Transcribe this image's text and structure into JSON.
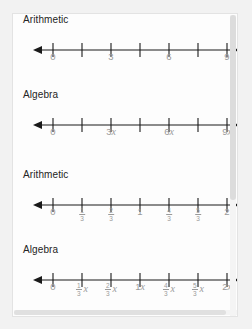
{
  "viewer": {
    "name": "number-line-worksheet",
    "scrollbars": {
      "vertical_name": "vertical-scrollbar",
      "horizontal_name": "horizontal-scrollbar"
    }
  },
  "colors": {
    "page_background": "#fdfdfd",
    "app_background": "#f2f2f2",
    "label_text": "#242424",
    "tick_label_text": "#9a9a9a",
    "axis": "#1a1a1a",
    "border": "#e3e3e3"
  },
  "groups": [
    {
      "id": "group-whole-numbers",
      "blocks": [
        {
          "id": "arithmetic-whole",
          "label": "Arithmetic",
          "tick_count": 7,
          "labels": [
            {
              "tick": 0,
              "text": "0",
              "type": "plain"
            },
            {
              "tick": 1,
              "text": "",
              "type": "none"
            },
            {
              "tick": 2,
              "text": "3",
              "type": "plain"
            },
            {
              "tick": 3,
              "text": "",
              "type": "none"
            },
            {
              "tick": 4,
              "text": "6",
              "type": "plain"
            },
            {
              "tick": 5,
              "text": "",
              "type": "none"
            },
            {
              "tick": 6,
              "text": "9",
              "type": "plain"
            }
          ]
        },
        {
          "id": "algebra-whole",
          "label": "Algebra",
          "tick_count": 7,
          "labels": [
            {
              "tick": 0,
              "text": "0",
              "type": "plain"
            },
            {
              "tick": 1,
              "text": "",
              "type": "none"
            },
            {
              "tick": 2,
              "text": "3",
              "type": "variable",
              "variable": "x"
            },
            {
              "tick": 3,
              "text": "",
              "type": "none"
            },
            {
              "tick": 4,
              "text": "6",
              "type": "variable",
              "variable": "x"
            },
            {
              "tick": 5,
              "text": "",
              "type": "none"
            },
            {
              "tick": 6,
              "text": "9",
              "type": "variable",
              "variable": "x"
            }
          ]
        }
      ]
    },
    {
      "id": "group-thirds",
      "blocks": [
        {
          "id": "arithmetic-thirds",
          "label": "Arithmetic",
          "tick_count": 7,
          "labels": [
            {
              "tick": 0,
              "text": "0",
              "type": "plain"
            },
            {
              "tick": 1,
              "type": "fraction",
              "numerator": "1",
              "denominator": "3"
            },
            {
              "tick": 2,
              "type": "fraction",
              "numerator": "2",
              "denominator": "3"
            },
            {
              "tick": 3,
              "text": "1",
              "type": "plain"
            },
            {
              "tick": 4,
              "type": "fraction",
              "numerator": "4",
              "denominator": "3"
            },
            {
              "tick": 5,
              "type": "fraction",
              "numerator": "5",
              "denominator": "3"
            },
            {
              "tick": 6,
              "text": "2",
              "type": "plain"
            }
          ]
        },
        {
          "id": "algebra-thirds",
          "label": "Algebra",
          "tick_count": 7,
          "labels": [
            {
              "tick": 0,
              "text": "0",
              "type": "plain"
            },
            {
              "tick": 1,
              "type": "fraction-variable",
              "numerator": "1",
              "denominator": "3",
              "variable": "x"
            },
            {
              "tick": 2,
              "type": "fraction-variable",
              "numerator": "2",
              "denominator": "3",
              "variable": "x"
            },
            {
              "tick": 3,
              "text": "1",
              "type": "variable",
              "variable": "x"
            },
            {
              "tick": 4,
              "type": "fraction-variable",
              "numerator": "4",
              "denominator": "3",
              "variable": "x"
            },
            {
              "tick": 5,
              "type": "fraction-variable",
              "numerator": "5",
              "denominator": "3",
              "variable": "x"
            },
            {
              "tick": 6,
              "text": "2",
              "type": "variable",
              "variable": "x"
            }
          ]
        }
      ]
    }
  ],
  "chart_data": {
    "type": "line",
    "title": "",
    "xlabel": "",
    "ylabel": "",
    "lines": [
      {
        "name": "Arithmetic (multiples of 3)",
        "tick_values": [
          0,
          1.5,
          3,
          4.5,
          6,
          7.5,
          9
        ],
        "tick_labels": [
          "0",
          "",
          "3",
          "",
          "6",
          "",
          "9"
        ],
        "xlim": [
          -0.75,
          9.75
        ]
      },
      {
        "name": "Algebra (multiples of 3x)",
        "tick_values": [
          0,
          1.5,
          3,
          4.5,
          6,
          7.5,
          9
        ],
        "tick_labels": [
          "0",
          "",
          "3x",
          "",
          "6x",
          "",
          "9x"
        ],
        "xlim": [
          -0.75,
          9.75
        ]
      },
      {
        "name": "Arithmetic (thirds)",
        "tick_values": [
          0,
          0.3333,
          0.6667,
          1,
          1.3333,
          1.6667,
          2
        ],
        "tick_labels": [
          "0",
          "1/3",
          "2/3",
          "1",
          "4/3",
          "5/3",
          "2"
        ],
        "xlim": [
          -0.1667,
          2.1667
        ]
      },
      {
        "name": "Algebra (thirds times x)",
        "tick_values": [
          0,
          0.3333,
          0.6667,
          1,
          1.3333,
          1.6667,
          2
        ],
        "tick_labels": [
          "0",
          "1/3 x",
          "2/3 x",
          "1x",
          "4/3 x",
          "5/3 x",
          "2x"
        ],
        "xlim": [
          -0.1667,
          2.1667
        ]
      }
    ]
  },
  "geometry": {
    "tick_start_x": 40,
    "tick_spacing": 29,
    "arrow_left_x": 24,
    "arrow_right_x": 220
  }
}
